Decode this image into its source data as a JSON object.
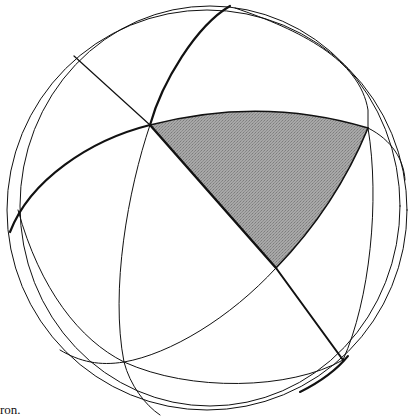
{
  "figure": {
    "type": "sphere-with-great-circles",
    "colors": {
      "background": "#ffffff",
      "line": "#111111",
      "shaded_region": "#9a9a9a"
    },
    "sphere": {
      "center": [
        207,
        210
      ],
      "radius": 200
    },
    "shaded_triangle": {
      "vertices": [
        [
          150,
          125
        ],
        [
          368,
          128
        ],
        [
          276,
          268
        ]
      ]
    },
    "intersection_points": [
      [
        150,
        125
      ],
      [
        368,
        128
      ],
      [
        276,
        268
      ],
      [
        124,
        362
      ],
      [
        343,
        360
      ],
      [
        74,
        56
      ],
      [
        230,
        6
      ]
    ]
  },
  "caption": {
    "text": "ron."
  }
}
